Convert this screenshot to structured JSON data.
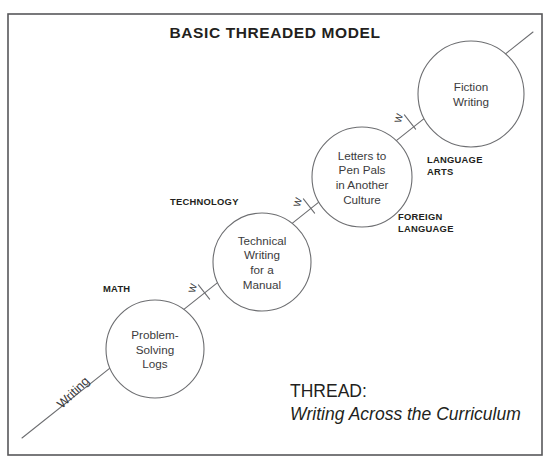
{
  "figure": {
    "title": "BASIC THREADED MODEL",
    "frame": {
      "x": 8,
      "y": 14,
      "width": 534,
      "height": 441
    },
    "colors": {
      "background": "#ffffff",
      "frame_stroke": "#58585a",
      "circle_stroke": "#6d6e71",
      "text": "#231f20",
      "node_text": "#3b3b3d"
    }
  },
  "caption": {
    "label": "THREAD:",
    "value": "Writing Across the Curriculum",
    "x": 290,
    "label_y": 397,
    "value_y": 420
  },
  "thread": {
    "word": "Writing",
    "word_x": 62,
    "word_y": 409,
    "word_rotation": -44,
    "start": {
      "x": 22,
      "y": 438
    },
    "end": {
      "x": 533,
      "y": 32
    },
    "markers": [
      {
        "label": "W",
        "x": 196,
        "y": 289,
        "rotation": -75
      },
      {
        "label": "W",
        "x": 301,
        "y": 203,
        "rotation": -75
      },
      {
        "label": "W",
        "x": 402,
        "y": 119,
        "rotation": -75
      }
    ]
  },
  "nodes": [
    {
      "id": "math",
      "subject": "MATH",
      "subject_x": 103,
      "subject_y": 292,
      "subject_anchor": "start",
      "cx": 155,
      "cy": 349,
      "r": 49,
      "lines": [
        "Problem-",
        "Solving",
        "Logs"
      ]
    },
    {
      "id": "technology",
      "subject": "TECHNOLOGY",
      "subject_x": 170,
      "subject_y": 205,
      "subject_anchor": "start",
      "cx": 262,
      "cy": 262,
      "r": 49,
      "lines": [
        "Technical",
        "Writing",
        "for a",
        "Manual"
      ]
    },
    {
      "id": "foreign-language",
      "subject": "FOREIGN\nLANGUAGE",
      "subject_x": 398,
      "subject_y": 220,
      "subject_anchor": "start",
      "cx": 362,
      "cy": 177,
      "r": 50,
      "lines": [
        "Letters to",
        "Pen Pals",
        "in Another",
        "Culture"
      ]
    },
    {
      "id": "language-arts",
      "subject": "LANGUAGE\nARTS",
      "subject_x": 427,
      "subject_y": 163,
      "subject_anchor": "start",
      "cx": 471,
      "cy": 94,
      "r": 53,
      "lines": [
        "Fiction",
        "Writing"
      ]
    }
  ]
}
